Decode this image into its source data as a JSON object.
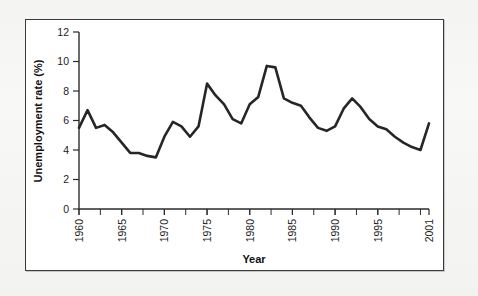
{
  "figure": {
    "frame_color": "#3a3a3a",
    "background": "#ffffff"
  },
  "chart_data": {
    "type": "line",
    "title": "",
    "xlabel": "Year",
    "ylabel": "Unemployment rate (%)",
    "xlim": [
      1960,
      2001
    ],
    "ylim": [
      0,
      12
    ],
    "ytick_labels": [
      "0",
      "2",
      "4",
      "6",
      "8",
      "10",
      "12"
    ],
    "ytick_values": [
      0,
      2,
      4,
      6,
      8,
      10,
      12
    ],
    "xtick_labels": [
      "1960",
      "1965",
      "1970",
      "1975",
      "1980",
      "1985",
      "1990",
      "1995",
      "2001"
    ],
    "xtick_values": [
      1960,
      1965,
      1970,
      1975,
      1980,
      1985,
      1990,
      1995,
      2001
    ],
    "xtick_minor_step": 2.5,
    "grid": false,
    "legend": "none",
    "line_color": "#262626",
    "x": [
      1960,
      1961,
      1962,
      1963,
      1964,
      1965,
      1966,
      1967,
      1968,
      1969,
      1970,
      1971,
      1972,
      1973,
      1974,
      1975,
      1976,
      1977,
      1978,
      1979,
      1980,
      1981,
      1982,
      1983,
      1984,
      1985,
      1986,
      1987,
      1988,
      1989,
      1990,
      1991,
      1992,
      1993,
      1994,
      1995,
      1996,
      1997,
      1998,
      1999,
      2000,
      2001
    ],
    "values": [
      5.5,
      6.7,
      5.5,
      5.7,
      5.2,
      4.5,
      3.8,
      3.8,
      3.6,
      3.5,
      4.9,
      5.9,
      5.6,
      4.9,
      5.6,
      8.5,
      7.7,
      7.1,
      6.1,
      5.8,
      7.1,
      7.6,
      9.7,
      9.6,
      7.5,
      7.2,
      7.0,
      6.2,
      5.5,
      5.3,
      5.6,
      6.8,
      7.5,
      6.9,
      6.1,
      5.6,
      5.4,
      4.9,
      4.5,
      4.2,
      4.0,
      5.8
    ]
  }
}
